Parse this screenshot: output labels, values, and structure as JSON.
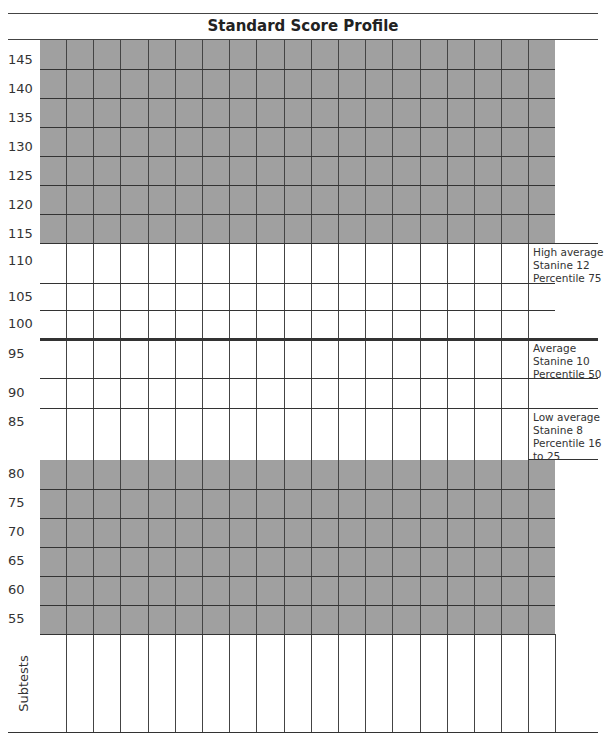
{
  "document": {
    "title": "Standard Score Profile",
    "y_axis_labels": [
      "145",
      "140",
      "135",
      "130",
      "125",
      "120",
      "115",
      "110",
      "105",
      "100",
      "95",
      "90",
      "85",
      "80",
      "75",
      "70",
      "65",
      "60",
      "55"
    ],
    "bottom_label": "Subtests",
    "bands": [
      {
        "name": "High average",
        "lines": [
          "High average",
          "Stanine 12",
          "Percentile 75"
        ]
      },
      {
        "name": "Average",
        "lines": [
          "Average",
          "Stanine 10",
          "Percentile 50"
        ]
      },
      {
        "name": "Low average",
        "lines": [
          "Low average",
          "Stanine 8",
          "Percentile 16",
          "to 25"
        ]
      }
    ],
    "subtest_columns": 18,
    "colors": {
      "shaded": "#a0a0a0",
      "line": "#333333",
      "mean_line": "#333333"
    }
  }
}
